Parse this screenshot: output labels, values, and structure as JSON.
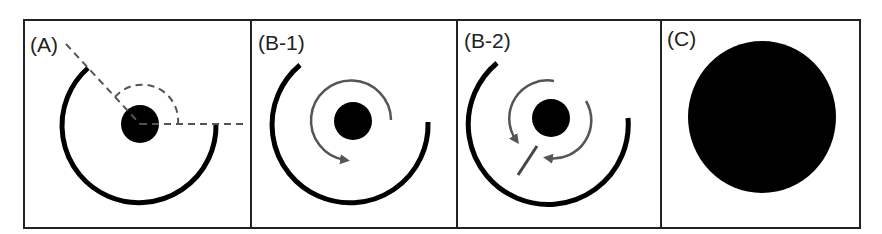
{
  "figure": {
    "panels": [
      {
        "id": "A",
        "label": "(A)"
      },
      {
        "id": "B-1",
        "label": "(B-1)"
      },
      {
        "id": "B-2",
        "label": "(B-2)"
      },
      {
        "id": "C",
        "label": "(C)"
      }
    ]
  },
  "colors": {
    "stroke": "#000000",
    "arrow": "#555555",
    "dash": "#555555",
    "border": "#222222"
  }
}
